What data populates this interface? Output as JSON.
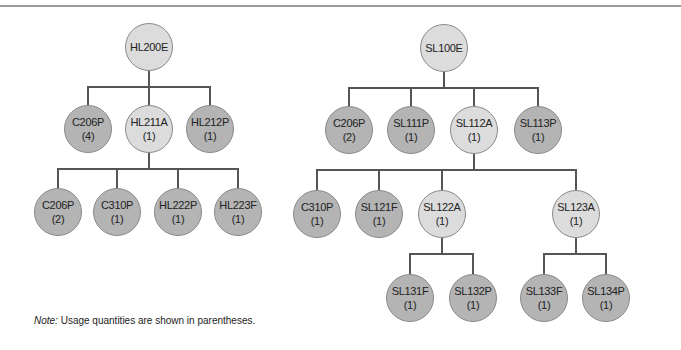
{
  "diagram": {
    "type": "product-structure-tree",
    "colors": {
      "assembly_fill": "#dcdcdc",
      "part_fill": "#b4b4b4",
      "line": "#555555"
    },
    "trees": [
      {
        "root": "HL200E",
        "nodes": [
          {
            "id": "hl200e",
            "label": "HL200E",
            "qty": "",
            "x": 149,
            "y": 47,
            "r": 24,
            "kind": "light"
          },
          {
            "id": "c206p_a",
            "label": "C206P",
            "qty": "(4)",
            "x": 88,
            "y": 129,
            "r": 24,
            "kind": "dark"
          },
          {
            "id": "hl211a",
            "label": "HL211A",
            "qty": "(1)",
            "x": 149,
            "y": 129,
            "r": 24,
            "kind": "light"
          },
          {
            "id": "hl212p",
            "label": "HL212P",
            "qty": "(1)",
            "x": 210,
            "y": 129,
            "r": 24,
            "kind": "dark"
          },
          {
            "id": "c206p_b",
            "label": "C206P",
            "qty": "(2)",
            "x": 58,
            "y": 212,
            "r": 24,
            "kind": "dark"
          },
          {
            "id": "c310p_a",
            "label": "C310P",
            "qty": "(1)",
            "x": 117,
            "y": 212,
            "r": 24,
            "kind": "dark"
          },
          {
            "id": "hl222p",
            "label": "HL222P",
            "qty": "(1)",
            "x": 178,
            "y": 212,
            "r": 24,
            "kind": "dark"
          },
          {
            "id": "hl223f",
            "label": "HL223F",
            "qty": "(1)",
            "x": 238,
            "y": 212,
            "r": 24,
            "kind": "dark"
          }
        ]
      },
      {
        "root": "SL100E",
        "nodes": [
          {
            "id": "sl100e",
            "label": "SL100E",
            "qty": "",
            "x": 444,
            "y": 48,
            "r": 24,
            "kind": "light"
          },
          {
            "id": "c206p_c",
            "label": "C206P",
            "qty": "(2)",
            "x": 349,
            "y": 130,
            "r": 24,
            "kind": "dark"
          },
          {
            "id": "sl111p",
            "label": "SL111P",
            "qty": "(1)",
            "x": 411,
            "y": 130,
            "r": 24,
            "kind": "dark"
          },
          {
            "id": "sl112a",
            "label": "SL112A",
            "qty": "(1)",
            "x": 474,
            "y": 130,
            "r": 24,
            "kind": "light"
          },
          {
            "id": "sl113p",
            "label": "SL113P",
            "qty": "(1)",
            "x": 538,
            "y": 130,
            "r": 24,
            "kind": "dark"
          },
          {
            "id": "c310p_b",
            "label": "C310P",
            "qty": "(1)",
            "x": 317,
            "y": 214,
            "r": 24,
            "kind": "dark"
          },
          {
            "id": "sl121f",
            "label": "SL121F",
            "qty": "(1)",
            "x": 379,
            "y": 214,
            "r": 24,
            "kind": "dark"
          },
          {
            "id": "sl122a",
            "label": "SL122A",
            "qty": "(1)",
            "x": 442,
            "y": 214,
            "r": 24,
            "kind": "light"
          },
          {
            "id": "sl123a",
            "label": "SL123A",
            "qty": "(1)",
            "x": 576,
            "y": 214,
            "r": 24,
            "kind": "light"
          },
          {
            "id": "sl131f",
            "label": "SL131F",
            "qty": "(1)",
            "x": 410,
            "y": 298,
            "r": 24,
            "kind": "dark"
          },
          {
            "id": "sl132p",
            "label": "SL132P",
            "qty": "(1)",
            "x": 473,
            "y": 298,
            "r": 24,
            "kind": "dark"
          },
          {
            "id": "sl133f",
            "label": "SL133F",
            "qty": "(1)",
            "x": 544,
            "y": 298,
            "r": 24,
            "kind": "dark"
          },
          {
            "id": "sl134p",
            "label": "SL134P",
            "qty": "(1)",
            "x": 606,
            "y": 298,
            "r": 24,
            "kind": "dark"
          }
        ]
      }
    ],
    "connectors": [
      {
        "parent_x": 149,
        "parent_y": 71,
        "bar_y": 87,
        "children_x": [
          88,
          149,
          210
        ],
        "child_y": 105
      },
      {
        "parent_x": 149,
        "parent_y": 153,
        "bar_y": 169,
        "children_x": [
          58,
          117,
          178,
          238
        ],
        "child_y": 188
      },
      {
        "parent_x": 444,
        "parent_y": 72,
        "bar_y": 88,
        "children_x": [
          349,
          411,
          474,
          538
        ],
        "child_y": 106
      },
      {
        "parent_x": 474,
        "parent_y": 154,
        "bar_y": 170,
        "children_x": [
          317,
          379,
          442,
          576
        ],
        "child_y": 190
      },
      {
        "parent_x": 442,
        "parent_y": 238,
        "bar_y": 254,
        "children_x": [
          410,
          473
        ],
        "child_y": 274
      },
      {
        "parent_x": 576,
        "parent_y": 238,
        "bar_y": 254,
        "children_x": [
          544,
          606
        ],
        "child_y": 274
      }
    ]
  },
  "note": {
    "label": "Note:",
    "text": " Usage quantities are shown in parentheses."
  }
}
